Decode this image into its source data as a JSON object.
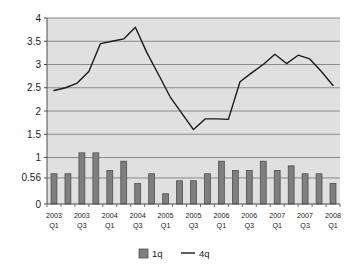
{
  "chart_data": {
    "type": "bar",
    "title": "",
    "subtitle": "",
    "xlabel": "",
    "ylabel": "",
    "ylim": [
      0,
      4
    ],
    "yticks": [
      0,
      0.56,
      1,
      1.5,
      2,
      2.5,
      3,
      3.5,
      4
    ],
    "ytick_labels": [
      "0",
      "0.56",
      "1",
      "1.5",
      "2",
      "2.5",
      "3",
      "3.5",
      "4"
    ],
    "grid": true,
    "grid_axis": "y",
    "legend_position": "bottom",
    "categories": [
      "2003 Q1",
      "2003 Q2",
      "2003 Q3",
      "2003 Q4",
      "2004 Q1",
      "2004 Q2",
      "2004 Q3",
      "2004 Q4",
      "2005 Q1",
      "2005 Q2",
      "2005 Q3",
      "2005 Q4",
      "2006 Q1",
      "2006 Q2",
      "2006 Q3",
      "2006 Q4",
      "2007 Q1",
      "2007 Q2",
      "2007 Q3",
      "2007 Q4",
      "2008 Q1"
    ],
    "xtick_labels": [
      {
        "year": "2003",
        "quarter": "Q1",
        "index": 0
      },
      {
        "year": "2003",
        "quarter": "Q3",
        "index": 2
      },
      {
        "year": "2004",
        "quarter": "Q1",
        "index": 4
      },
      {
        "year": "2004",
        "quarter": "Q3",
        "index": 6
      },
      {
        "year": "2005",
        "quarter": "Q1",
        "index": 8
      },
      {
        "year": "2005",
        "quarter": "Q3",
        "index": 10
      },
      {
        "year": "2006",
        "quarter": "Q1",
        "index": 12
      },
      {
        "year": "2006",
        "quarter": "Q3",
        "index": 14
      },
      {
        "year": "2007",
        "quarter": "Q1",
        "index": 16
      },
      {
        "year": "2007",
        "quarter": "Q3",
        "index": 18
      },
      {
        "year": "2008",
        "quarter": "Q1",
        "index": 20
      }
    ],
    "series": [
      {
        "name": "1q",
        "type": "bar",
        "color": "#7f7f7f",
        "edge_color": "#4d4d4d",
        "values": [
          0.65,
          0.65,
          1.1,
          1.1,
          0.72,
          0.92,
          0.44,
          0.65,
          0.22,
          0.5,
          0.5,
          0.65,
          0.92,
          0.72,
          0.72,
          0.92,
          0.72,
          0.82,
          0.65,
          0.65,
          0.44
        ]
      },
      {
        "name": "4q",
        "type": "line",
        "color": "#1a1a1a",
        "values": [
          2.44,
          2.5,
          2.6,
          2.85,
          3.45,
          3.5,
          3.55,
          3.8,
          3.25,
          2.78,
          2.3,
          1.95,
          1.6,
          1.83,
          1.83,
          1.82,
          2.63,
          2.82,
          3.0,
          3.22,
          3.02
        ],
        "values_tail": [
          3.2,
          3.12,
          2.85,
          2.55
        ]
      }
    ],
    "line_values_full": [
      2.44,
      2.5,
      2.6,
      2.85,
      3.45,
      3.5,
      3.55,
      3.8,
      3.25,
      2.78,
      2.3,
      1.95,
      1.6,
      1.83,
      1.83,
      1.82,
      2.63,
      2.82,
      3.0,
      3.22,
      3.02,
      3.2,
      3.12,
      2.85,
      2.55
    ]
  },
  "legend": {
    "items": [
      {
        "label": "1q",
        "marker": "square",
        "color": "#7f7f7f"
      },
      {
        "label": "4q",
        "marker": "line",
        "color": "#1a1a1a"
      }
    ]
  },
  "style": {
    "plot_background": "#e0e0e0",
    "grid_color": "#808080",
    "axis_color": "#4d4d4d",
    "page_background": "#ffffff",
    "text_color": "#1a1a1a"
  }
}
